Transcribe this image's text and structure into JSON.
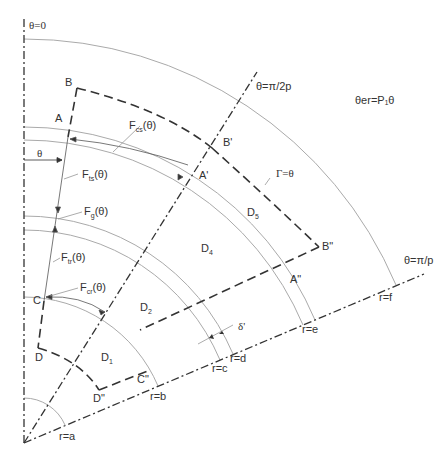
{
  "diagram": {
    "type": "polar-sector-schematic",
    "axes": {
      "theta_zero": "θ=0",
      "theta_half": "θ=π/2p",
      "theta_full": "θ=π/p"
    },
    "equation": "θer=P₁θ",
    "boundary": "Γ=θ",
    "points": {
      "A": "A",
      "B": "B",
      "C": "C",
      "D": "D",
      "A1": "A'",
      "B1": "B'",
      "A2": "A\"",
      "B2": "B\"",
      "C2": "C\"",
      "D2": "D\""
    },
    "regions": {
      "D1": {
        "main": "D",
        "sub": "1"
      },
      "D2": {
        "main": "D",
        "sub": "2"
      },
      "D4": {
        "main": "D",
        "sub": "4"
      },
      "D5": {
        "main": "D",
        "sub": "5"
      }
    },
    "forces": {
      "Fcs": {
        "main": "F",
        "sub": "cs",
        "arg": "(θ)"
      },
      "Fts": {
        "main": "F",
        "sub": "ts",
        "arg": "(θ)"
      },
      "Fg": {
        "main": "F",
        "sub": "g",
        "arg": "(θ)"
      },
      "Ftr": {
        "main": "F",
        "sub": "tr",
        "arg": "(θ)"
      },
      "Fcr": {
        "main": "F",
        "sub": "cr",
        "arg": "(θ)"
      }
    },
    "angle_label": "θ",
    "gap_label": "δ'",
    "radii": {
      "a": "r=a",
      "b": "r=b",
      "c": "r=c",
      "d": "r=d",
      "e": "r=e",
      "f": "r=f"
    },
    "colors": {
      "line": "#333333",
      "arc": "#aaaaaa",
      "text": "#333333"
    }
  }
}
